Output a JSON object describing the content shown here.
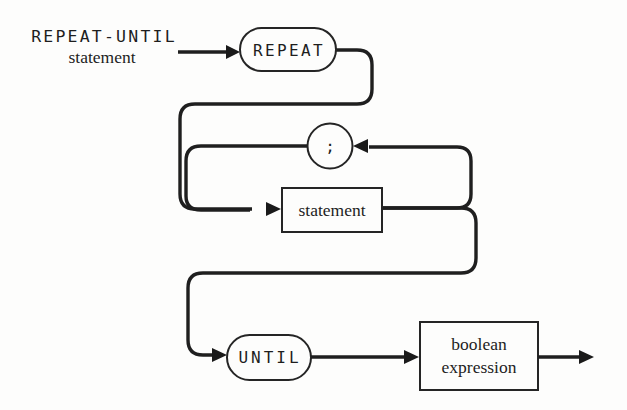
{
  "diagram": {
    "kind": "railroad-syntax-diagram",
    "heading": {
      "line1": "REPEAT-UNTIL",
      "line2": "statement"
    },
    "nodes": {
      "repeat": {
        "label": "REPEAT",
        "shape": "rounded-terminal"
      },
      "semicolon": {
        "label": ";",
        "shape": "circle-terminal"
      },
      "statement": {
        "label": "statement",
        "shape": "rectangle-nonterminal"
      },
      "until": {
        "label": "UNTIL",
        "shape": "rounded-terminal"
      },
      "boolean_expression": {
        "line1": "boolean",
        "line2": "expression",
        "shape": "rectangle-nonterminal"
      }
    },
    "colors": {
      "paper": "#fdfdfc",
      "ink": "#1f1f1f"
    }
  }
}
